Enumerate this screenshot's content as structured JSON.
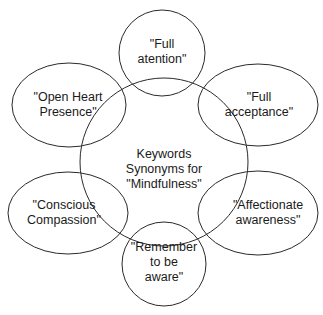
{
  "diagram": {
    "type": "mind-map",
    "stroke_color": "#2a2a2a",
    "background": "#ffffff",
    "center": {
      "id": "center",
      "lines": [
        "Keywords",
        "Synonyms for",
        "\"Mindfulness\""
      ],
      "text": "Keywords\nSynonyms for\n\"Mindfulness\""
    },
    "nodes": [
      {
        "id": "full-attention",
        "shape": "circle",
        "text": "\"Full\natention\""
      },
      {
        "id": "full-acceptance",
        "shape": "ellipse",
        "text": "\"Full\nacceptance\""
      },
      {
        "id": "affectionate-awareness",
        "shape": "ellipse",
        "text": "\"Affectionate\nawareness\""
      },
      {
        "id": "remember-to-be-aware",
        "shape": "circle",
        "text": "\"Remember\nto be\naware\""
      },
      {
        "id": "conscious-compassion",
        "shape": "ellipse",
        "text": "\"Conscious\nCompassion\""
      },
      {
        "id": "open-heart-presence",
        "shape": "ellipse",
        "text": "\"Open Heart\nPresence\""
      }
    ]
  }
}
